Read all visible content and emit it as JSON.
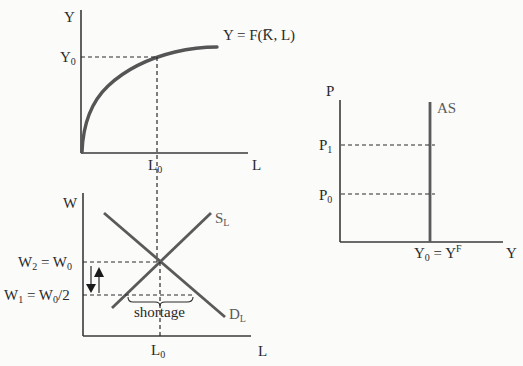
{
  "diagram": {
    "colors": {
      "background": "#fbfbfa",
      "axis": "#3a3a3a",
      "curves": "#555555",
      "text": "#2a2a2a"
    },
    "production_panel": {
      "y_axis_label": "Y",
      "x_axis_label": "L",
      "y_tick_label": "Y",
      "y_tick_sub": "0",
      "x_tick_label": "L",
      "x_tick_sub": "0",
      "curve_label": "Y = F(K̅, L)"
    },
    "labor_market_panel": {
      "y_axis_label": "W",
      "x_axis_label": "L",
      "w2_label_a": "W",
      "w2_sub_a": "2",
      "w2_eq": " = W",
      "w2_sub_b": "0",
      "w1_label_a": "W",
      "w1_sub_a": "1",
      "w1_eq": " = W",
      "w1_sub_b": "0",
      "w1_tail": "/2",
      "supply_label": "S",
      "supply_sub": "L",
      "demand_label": "D",
      "demand_sub": "L",
      "shortage_label": "shortage",
      "x_tick_label": "L",
      "x_tick_sub": "0"
    },
    "as_panel": {
      "y_axis_label": "P",
      "x_axis_label": "Y",
      "as_label": "AS",
      "p1_label": "P",
      "p1_sub": "1",
      "p0_label": "P",
      "p0_sub": "0",
      "x_tick_label_a": "Y",
      "x_tick_sub": "0",
      "x_tick_eq": " = Y",
      "x_tick_sup": "F"
    }
  }
}
